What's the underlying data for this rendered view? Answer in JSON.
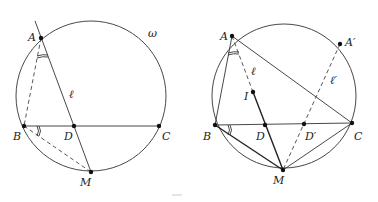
{
  "figures": [
    {
      "id": "left",
      "circle": {
        "cx": 91,
        "cy": 96,
        "r": 75,
        "label": "ω",
        "label_pos": [
          148,
          37
        ]
      },
      "points": [
        {
          "name": "A",
          "x": 41,
          "y": 38,
          "lx": 28,
          "ly": 41
        },
        {
          "name": "B",
          "x": 24,
          "y": 126,
          "lx": 13,
          "ly": 140
        },
        {
          "name": "D",
          "x": 74,
          "y": 126,
          "lx": 64,
          "ly": 140
        },
        {
          "name": "C",
          "x": 159,
          "y": 126,
          "lx": 162,
          "ly": 140
        },
        {
          "name": "M",
          "x": 91,
          "y": 172,
          "lx": 80,
          "ly": 186
        }
      ],
      "line_label": {
        "text": "ℓ",
        "x": 69,
        "y": 98
      }
    },
    {
      "id": "right",
      "circle": {
        "cx": 284,
        "cy": 96,
        "r": 72
      },
      "points": [
        {
          "name": "A",
          "x": 232,
          "y": 36,
          "lx": 220,
          "ly": 40
        },
        {
          "name": "A′",
          "x": 340,
          "y": 44,
          "lx": 345,
          "ly": 46
        },
        {
          "name": "I",
          "x": 253,
          "y": 92,
          "lx": 244,
          "ly": 100
        },
        {
          "name": "B",
          "x": 215,
          "y": 125,
          "lx": 203,
          "ly": 140
        },
        {
          "name": "D",
          "x": 265,
          "y": 125,
          "lx": 256,
          "ly": 140
        },
        {
          "name": "D′",
          "x": 304,
          "y": 125,
          "lx": 305,
          "ly": 140
        },
        {
          "name": "C",
          "x": 352,
          "y": 123,
          "lx": 354,
          "ly": 140
        },
        {
          "name": "M",
          "x": 283,
          "y": 170,
          "lx": 273,
          "ly": 184
        }
      ],
      "line_labels": [
        {
          "text": "ℓ",
          "x": 251,
          "y": 75
        },
        {
          "text": "ℓ′",
          "x": 330,
          "y": 84
        }
      ]
    }
  ]
}
